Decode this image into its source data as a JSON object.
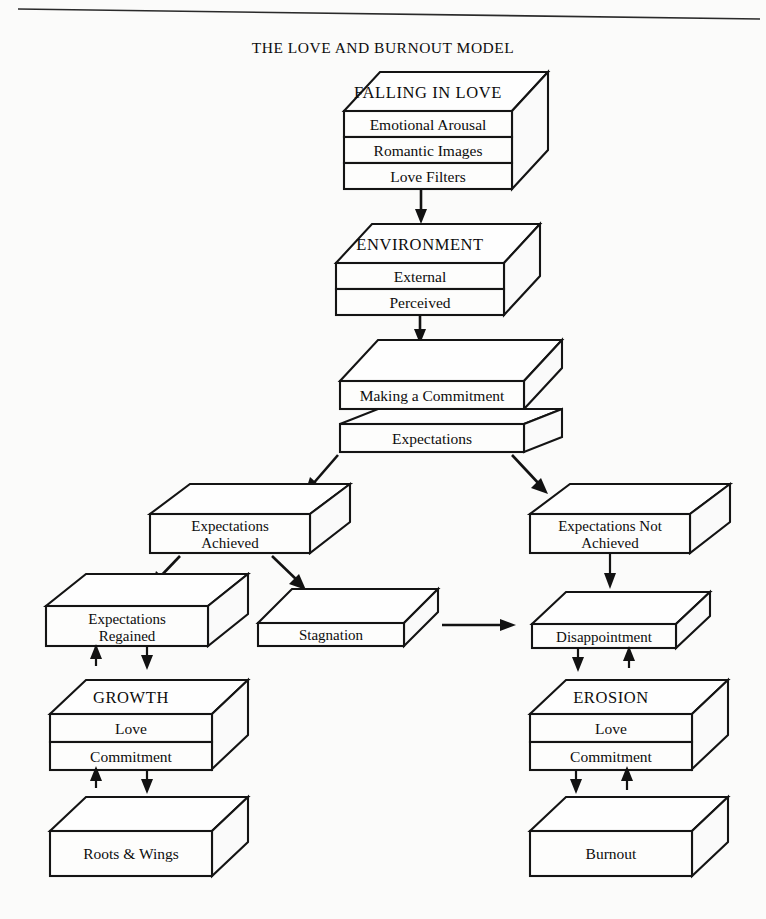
{
  "document": {
    "title": "THE LOVE AND BURNOUT MODEL"
  },
  "diagram": {
    "type": "flowchart",
    "nodes": [
      {
        "id": "falling-in-love",
        "header": "FALLING IN LOVE",
        "layers": [
          "Emotional Arousal",
          "Romantic Images",
          "Love Filters"
        ]
      },
      {
        "id": "environment",
        "header": "ENVIRONMENT",
        "layers": [
          "External",
          "Perceived"
        ]
      },
      {
        "id": "commitment",
        "header": "",
        "layers": [
          "Making a Commitment",
          "Expectations"
        ]
      },
      {
        "id": "expectations-achieved",
        "header": "",
        "layers": [
          "Expectations",
          "Achieved"
        ]
      },
      {
        "id": "expectations-not-achieved",
        "header": "",
        "layers": [
          "Expectations Not",
          "Achieved"
        ]
      },
      {
        "id": "expectations-regained",
        "header": "",
        "layers": [
          "Expectations",
          "Regained"
        ]
      },
      {
        "id": "stagnation",
        "header": "",
        "layers": [
          "Stagnation"
        ]
      },
      {
        "id": "disappointment",
        "header": "",
        "layers": [
          "Disappointment"
        ]
      },
      {
        "id": "growth",
        "header": "GROWTH",
        "layers": [
          "Love",
          "Commitment"
        ]
      },
      {
        "id": "erosion",
        "header": "EROSION",
        "layers": [
          "Love",
          "Commitment"
        ]
      },
      {
        "id": "roots-and-wings",
        "header": "",
        "layers": [
          "Roots & Wings"
        ]
      },
      {
        "id": "burnout",
        "header": "",
        "layers": [
          "Burnout"
        ]
      }
    ],
    "labels": {
      "falling_in_love_header": "FALLING IN LOVE",
      "falling_in_love_l1": "Emotional Arousal",
      "falling_in_love_l2": "Romantic Images",
      "falling_in_love_l3": "Love Filters",
      "environment_header": "ENVIRONMENT",
      "environment_l1": "External",
      "environment_l2": "Perceived",
      "commitment_l1": "Making a Commitment",
      "commitment_l2": "Expectations",
      "achieved_line1": "Expectations",
      "achieved_line2": "Achieved",
      "not_achieved_line1": "Expectations Not",
      "not_achieved_line2": "Achieved",
      "regained_line1": "Expectations",
      "regained_line2": "Regained",
      "stagnation": "Stagnation",
      "disappointment": "Disappointment",
      "growth_header": "GROWTH",
      "growth_l1": "Love",
      "growth_l2": "Commitment",
      "erosion_header": "EROSION",
      "erosion_l1": "Love",
      "erosion_l2": "Commitment",
      "roots_and_wings": "Roots & Wings",
      "burnout": "Burnout"
    },
    "edges": [
      {
        "from": "falling-in-love",
        "to": "environment",
        "style": "arrow-down"
      },
      {
        "from": "environment",
        "to": "commitment",
        "style": "arrow-down"
      },
      {
        "from": "commitment",
        "to": "expectations-achieved",
        "style": "arrow-diagonal-left"
      },
      {
        "from": "commitment",
        "to": "expectations-not-achieved",
        "style": "arrow-diagonal-right"
      },
      {
        "from": "expectations-achieved",
        "to": "expectations-regained",
        "style": "arrow-diagonal-left"
      },
      {
        "from": "expectations-achieved",
        "to": "stagnation",
        "style": "arrow-diagonal-right"
      },
      {
        "from": "stagnation",
        "to": "disappointment",
        "style": "arrow-right"
      },
      {
        "from": "expectations-not-achieved",
        "to": "disappointment",
        "style": "arrow-down"
      },
      {
        "from": "expectations-regained",
        "to": "growth",
        "style": "arrow-bidirectional"
      },
      {
        "from": "growth",
        "to": "roots-and-wings",
        "style": "arrow-bidirectional"
      },
      {
        "from": "disappointment",
        "to": "erosion",
        "style": "arrow-bidirectional"
      },
      {
        "from": "erosion",
        "to": "burnout",
        "style": "arrow-bidirectional"
      }
    ]
  },
  "colors": {
    "paper": "#fbfbfa",
    "ink": "#121212",
    "face": "#fdfdfc"
  }
}
